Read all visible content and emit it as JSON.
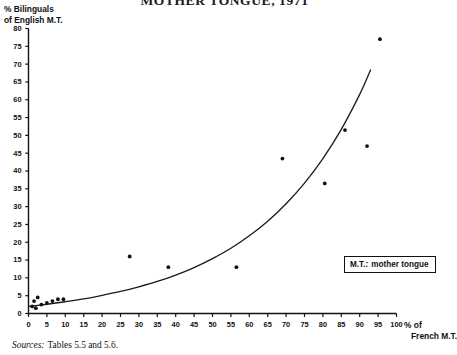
{
  "chart_data": {
    "type": "scatter",
    "title": "MOTHER TONGUE, 1971",
    "xlabel": "% of French M.T.",
    "ylabel": "% Bilinguals of English M.T.",
    "xlim": [
      0,
      100
    ],
    "ylim": [
      0,
      80
    ],
    "xticks": [
      0,
      5,
      10,
      15,
      20,
      25,
      30,
      35,
      40,
      45,
      50,
      55,
      60,
      65,
      70,
      75,
      80,
      85,
      90,
      95,
      100
    ],
    "yticks": [
      0,
      5,
      10,
      15,
      20,
      25,
      30,
      35,
      40,
      45,
      50,
      55,
      60,
      65,
      70,
      75,
      80
    ],
    "grid": false,
    "legend_position": "inside-right",
    "points": [
      {
        "x": 1.0,
        "y": 2.0
      },
      {
        "x": 1.5,
        "y": 3.5
      },
      {
        "x": 2.0,
        "y": 1.5
      },
      {
        "x": 2.5,
        "y": 4.5
      },
      {
        "x": 3.5,
        "y": 2.5
      },
      {
        "x": 5.0,
        "y": 3.0
      },
      {
        "x": 6.5,
        "y": 3.5
      },
      {
        "x": 8.0,
        "y": 4.0
      },
      {
        "x": 9.5,
        "y": 4.0
      },
      {
        "x": 27.5,
        "y": 16.0
      },
      {
        "x": 38.0,
        "y": 13.0
      },
      {
        "x": 56.5,
        "y": 13.0
      },
      {
        "x": 69.0,
        "y": 43.5
      },
      {
        "x": 80.5,
        "y": 36.5
      },
      {
        "x": 86.0,
        "y": 51.5
      },
      {
        "x": 92.0,
        "y": 47.0
      },
      {
        "x": 95.5,
        "y": 77.0
      }
    ],
    "curve": {
      "name": "fitted exponential trend",
      "x": [
        0,
        5,
        10,
        15,
        20,
        25,
        30,
        35,
        40,
        45,
        50,
        55,
        60,
        65,
        70,
        75,
        80,
        85,
        90,
        93
      ],
      "y": [
        2.0,
        2.6,
        3.3,
        4.1,
        5.1,
        6.2,
        7.5,
        9.0,
        10.8,
        12.9,
        15.4,
        18.3,
        21.8,
        25.9,
        30.8,
        36.6,
        43.5,
        51.7,
        61.5,
        68.5
      ]
    }
  },
  "legend": {
    "abbr": "M.T.:",
    "expansion": "mother tongue"
  },
  "axis_titles": {
    "y_line1": "% Bilinguals",
    "y_line2": "of English M.T.",
    "x_line1": "% of",
    "x_line2": "French M.T."
  },
  "source": {
    "word": "Sources:",
    "text": "Tables 5.5 and 5.6."
  }
}
